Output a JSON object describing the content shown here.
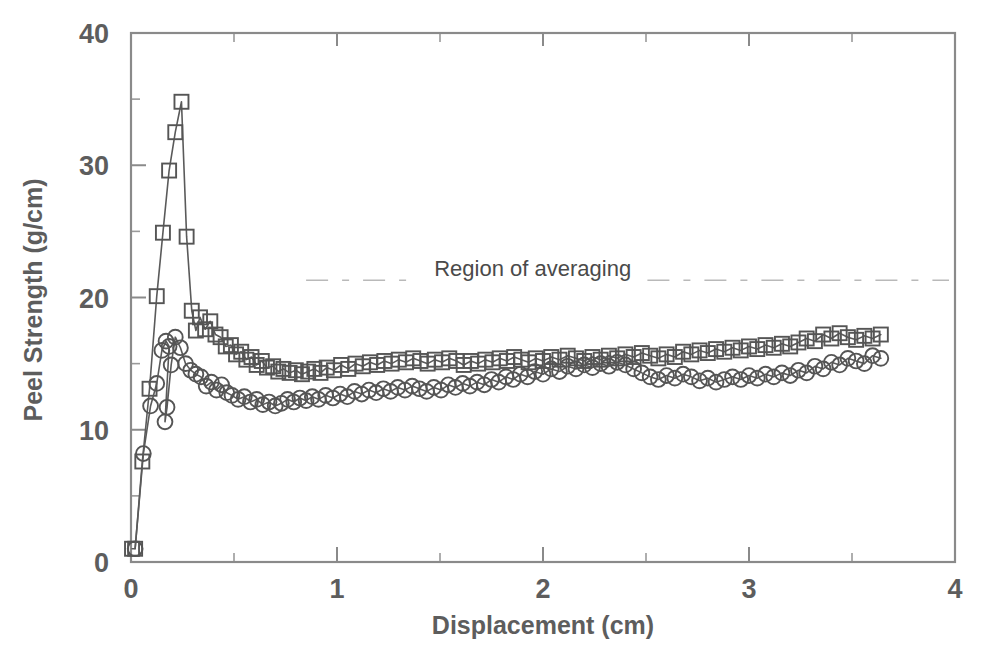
{
  "figure": {
    "background": "#ffffff",
    "ink_color": "#5a5a5a",
    "marker_color": "#555555",
    "frame_color": "#8a8a8a"
  },
  "chart_data": {
    "type": "line",
    "title": "",
    "xlabel": "Displacement (cm)",
    "ylabel": "Peel Strength (g/cm)",
    "xlim": [
      0,
      4
    ],
    "ylim": [
      0,
      40
    ],
    "xticks": [
      0,
      1,
      2,
      3,
      4
    ],
    "xtick_labels": [
      "0",
      "1",
      "2",
      "3",
      "4"
    ],
    "yticks": [
      0,
      10,
      20,
      30,
      40
    ],
    "ytick_labels": [
      "0",
      "10",
      "20",
      "30",
      "40"
    ],
    "xticks_minor": [
      0.5,
      1.5,
      2.5,
      3.5
    ],
    "yticks_minor": [
      5,
      15,
      25,
      35
    ],
    "grid": false,
    "legend": false,
    "annotations": [
      {
        "name": "region-of-averaging",
        "text": "Region of averaging",
        "x_text": 1.95,
        "y_text": 21.6,
        "line_y": 21.3,
        "line_x_start": 0.85,
        "line_x_end": 4.0,
        "style": "dashed"
      }
    ],
    "series": [
      {
        "name": "square-series",
        "marker": "square",
        "x": [
          0.005,
          0.02,
          0.055,
          0.09,
          0.125,
          0.155,
          0.185,
          0.215,
          0.245,
          0.27,
          0.295,
          0.315,
          0.335,
          0.36,
          0.385,
          0.41,
          0.435,
          0.46,
          0.485,
          0.51,
          0.535,
          0.56,
          0.585,
          0.61,
          0.635,
          0.66,
          0.69,
          0.715,
          0.74,
          0.77,
          0.8,
          0.83,
          0.86,
          0.89,
          0.92,
          0.95,
          0.985,
          1.02,
          1.055,
          1.09,
          1.125,
          1.16,
          1.195,
          1.23,
          1.265,
          1.3,
          1.335,
          1.37,
          1.405,
          1.44,
          1.475,
          1.51,
          1.545,
          1.58,
          1.615,
          1.65,
          1.685,
          1.72,
          1.755,
          1.79,
          1.825,
          1.86,
          1.895,
          1.93,
          1.965,
          2.0,
          2.04,
          2.08,
          2.12,
          2.16,
          2.2,
          2.24,
          2.28,
          2.32,
          2.36,
          2.4,
          2.44,
          2.48,
          2.52,
          2.56,
          2.6,
          2.64,
          2.68,
          2.72,
          2.76,
          2.8,
          2.84,
          2.88,
          2.92,
          2.96,
          3.0,
          3.04,
          3.08,
          3.12,
          3.16,
          3.2,
          3.24,
          3.28,
          3.32,
          3.36,
          3.4,
          3.44,
          3.48,
          3.52,
          3.56,
          3.6,
          3.64
        ],
        "y": [
          1.0,
          1.0,
          7.6,
          13.1,
          20.1,
          24.9,
          29.6,
          32.5,
          34.8,
          24.6,
          19.0,
          17.5,
          18.5,
          17.6,
          18.2,
          17.2,
          17.0,
          16.3,
          16.4,
          15.7,
          15.9,
          15.3,
          15.5,
          14.9,
          15.2,
          14.7,
          14.8,
          14.4,
          14.6,
          14.3,
          14.5,
          14.2,
          14.4,
          14.6,
          14.3,
          14.7,
          14.5,
          14.9,
          14.6,
          15.0,
          14.8,
          15.1,
          14.9,
          15.2,
          15.0,
          15.3,
          15.1,
          15.4,
          15.2,
          15.0,
          15.3,
          15.1,
          15.4,
          15.2,
          14.9,
          15.2,
          15.0,
          15.3,
          15.1,
          15.4,
          15.2,
          15.5,
          15.3,
          15.1,
          15.4,
          15.2,
          15.5,
          15.3,
          15.6,
          15.4,
          15.2,
          15.5,
          15.3,
          15.6,
          15.4,
          15.7,
          15.5,
          15.8,
          15.6,
          15.4,
          15.7,
          15.5,
          15.9,
          15.7,
          16.0,
          15.8,
          16.1,
          15.9,
          16.2,
          16.0,
          16.3,
          16.1,
          16.4,
          16.2,
          16.5,
          16.3,
          16.6,
          16.9,
          16.7,
          17.2,
          16.9,
          17.3,
          17.0,
          16.8,
          17.1,
          16.9,
          17.2
        ]
      },
      {
        "name": "circle-series",
        "marker": "circle",
        "x": [
          0.02,
          0.06,
          0.095,
          0.125,
          0.15,
          0.17,
          0.185,
          0.165,
          0.175,
          0.195,
          0.215,
          0.24,
          0.265,
          0.29,
          0.315,
          0.34,
          0.365,
          0.39,
          0.415,
          0.44,
          0.465,
          0.49,
          0.52,
          0.55,
          0.58,
          0.61,
          0.64,
          0.67,
          0.7,
          0.73,
          0.76,
          0.79,
          0.82,
          0.85,
          0.88,
          0.91,
          0.945,
          0.98,
          1.015,
          1.05,
          1.085,
          1.12,
          1.155,
          1.19,
          1.225,
          1.26,
          1.295,
          1.33,
          1.365,
          1.4,
          1.435,
          1.47,
          1.505,
          1.54,
          1.575,
          1.61,
          1.645,
          1.68,
          1.715,
          1.75,
          1.785,
          1.82,
          1.855,
          1.89,
          1.925,
          1.96,
          2.0,
          2.04,
          2.08,
          2.12,
          2.16,
          2.2,
          2.24,
          2.28,
          2.32,
          2.36,
          2.4,
          2.44,
          2.48,
          2.52,
          2.56,
          2.6,
          2.64,
          2.68,
          2.72,
          2.76,
          2.8,
          2.84,
          2.88,
          2.92,
          2.96,
          3.0,
          3.04,
          3.08,
          3.12,
          3.16,
          3.2,
          3.24,
          3.28,
          3.32,
          3.36,
          3.4,
          3.44,
          3.48,
          3.52,
          3.56,
          3.6,
          3.64
        ],
        "y": [
          1.0,
          8.2,
          11.8,
          13.5,
          16.0,
          16.7,
          16.3,
          10.6,
          11.7,
          14.9,
          17.0,
          16.2,
          15.0,
          14.5,
          14.2,
          14.0,
          13.3,
          13.6,
          13.0,
          13.4,
          12.8,
          12.6,
          12.3,
          12.5,
          12.1,
          12.3,
          11.9,
          12.1,
          11.8,
          12.0,
          12.3,
          12.1,
          12.4,
          12.2,
          12.5,
          12.3,
          12.6,
          12.4,
          12.7,
          12.5,
          12.9,
          12.7,
          13.0,
          12.8,
          13.1,
          12.9,
          13.2,
          13.0,
          13.3,
          13.1,
          12.9,
          13.2,
          13.0,
          13.4,
          13.2,
          13.5,
          13.3,
          13.6,
          13.4,
          13.8,
          13.6,
          14.0,
          13.8,
          14.2,
          14.0,
          14.4,
          14.2,
          14.6,
          14.4,
          14.8,
          14.6,
          14.9,
          14.7,
          15.0,
          14.8,
          15.1,
          14.9,
          14.6,
          14.3,
          14.0,
          13.8,
          14.1,
          13.9,
          14.2,
          14.0,
          13.7,
          13.9,
          13.6,
          13.8,
          14.0,
          13.8,
          14.1,
          13.9,
          14.2,
          14.0,
          14.3,
          14.1,
          14.5,
          14.3,
          14.8,
          14.6,
          15.1,
          14.9,
          15.4,
          15.2,
          15.0,
          15.6,
          15.4
        ]
      }
    ]
  }
}
